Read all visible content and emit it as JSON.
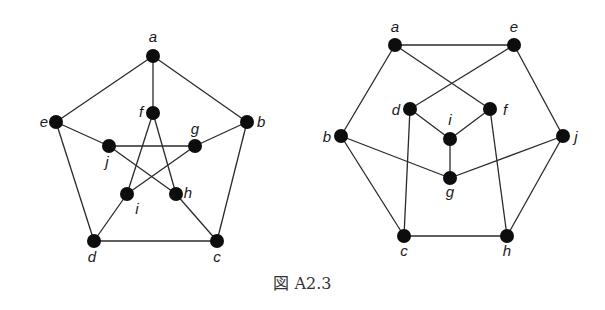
{
  "caption": "図 A2.3",
  "graphs": [
    {
      "name": "petersen-pentagon-star",
      "nodes": [
        {
          "id": "a",
          "x": 153,
          "y": 56,
          "lx": 153,
          "ly": 42,
          "anchor": "middle"
        },
        {
          "id": "b",
          "x": 247,
          "y": 122,
          "lx": 257,
          "ly": 127,
          "anchor": "start"
        },
        {
          "id": "c",
          "x": 217,
          "y": 241,
          "lx": 217,
          "ly": 262,
          "anchor": "middle"
        },
        {
          "id": "d",
          "x": 94,
          "y": 241,
          "lx": 92,
          "ly": 262,
          "anchor": "middle"
        },
        {
          "id": "e",
          "x": 56,
          "y": 122,
          "lx": 44,
          "ly": 127,
          "anchor": "middle"
        },
        {
          "id": "f",
          "x": 153,
          "y": 113,
          "lx": 141,
          "ly": 117,
          "anchor": "middle"
        },
        {
          "id": "g",
          "x": 195,
          "y": 146,
          "lx": 195,
          "ly": 134,
          "anchor": "middle"
        },
        {
          "id": "h",
          "x": 176,
          "y": 194,
          "lx": 188,
          "ly": 198,
          "anchor": "middle"
        },
        {
          "id": "i",
          "x": 127,
          "y": 194,
          "lx": 137,
          "ly": 214,
          "anchor": "middle"
        },
        {
          "id": "j",
          "x": 109,
          "y": 146,
          "lx": 107,
          "ly": 167,
          "anchor": "middle"
        }
      ],
      "edges": [
        [
          "a",
          "b"
        ],
        [
          "b",
          "c"
        ],
        [
          "c",
          "d"
        ],
        [
          "d",
          "e"
        ],
        [
          "e",
          "a"
        ],
        [
          "a",
          "f"
        ],
        [
          "b",
          "g"
        ],
        [
          "c",
          "h"
        ],
        [
          "d",
          "i"
        ],
        [
          "e",
          "j"
        ],
        [
          "f",
          "i"
        ],
        [
          "f",
          "h"
        ],
        [
          "g",
          "j"
        ],
        [
          "g",
          "i"
        ],
        [
          "h",
          "j"
        ]
      ]
    },
    {
      "name": "petersen-hexagon-layout",
      "nodes": [
        {
          "id": "a",
          "x": 395,
          "y": 45,
          "lx": 395,
          "ly": 32,
          "anchor": "middle"
        },
        {
          "id": "e",
          "x": 514,
          "y": 45,
          "lx": 514,
          "ly": 32,
          "anchor": "middle"
        },
        {
          "id": "d",
          "x": 410,
          "y": 109,
          "lx": 396,
          "ly": 115,
          "anchor": "middle"
        },
        {
          "id": "f",
          "x": 490,
          "y": 109,
          "lx": 505,
          "ly": 115,
          "anchor": "middle"
        },
        {
          "id": "i",
          "x": 450,
          "y": 139,
          "lx": 450,
          "ly": 125,
          "anchor": "middle"
        },
        {
          "id": "b",
          "x": 341,
          "y": 136,
          "lx": 327,
          "ly": 142,
          "anchor": "middle"
        },
        {
          "id": "j",
          "x": 563,
          "y": 136,
          "lx": 576,
          "ly": 142,
          "anchor": "middle"
        },
        {
          "id": "g",
          "x": 450,
          "y": 178,
          "lx": 450,
          "ly": 197,
          "anchor": "middle"
        },
        {
          "id": "c",
          "x": 404,
          "y": 236,
          "lx": 404,
          "ly": 256,
          "anchor": "middle"
        },
        {
          "id": "h",
          "x": 507,
          "y": 236,
          "lx": 507,
          "ly": 256,
          "anchor": "middle"
        }
      ],
      "edges": [
        [
          "a",
          "e"
        ],
        [
          "a",
          "b"
        ],
        [
          "a",
          "f"
        ],
        [
          "e",
          "d"
        ],
        [
          "e",
          "j"
        ],
        [
          "d",
          "i"
        ],
        [
          "f",
          "i"
        ],
        [
          "i",
          "g"
        ],
        [
          "b",
          "g"
        ],
        [
          "g",
          "j"
        ],
        [
          "b",
          "c"
        ],
        [
          "d",
          "c"
        ],
        [
          "f",
          "h"
        ],
        [
          "c",
          "h"
        ],
        [
          "j",
          "h"
        ]
      ]
    }
  ]
}
